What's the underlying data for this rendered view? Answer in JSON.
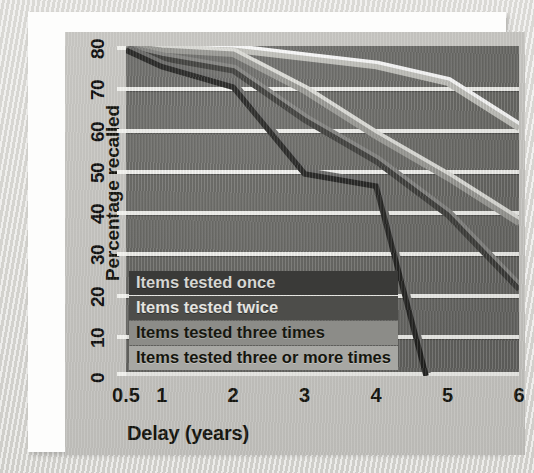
{
  "figure": {
    "panel_bg": "#c4c3bf",
    "plot_bg": "#6a6a67",
    "gridline_color": "#f4f4f0"
  },
  "chart_data": {
    "type": "line",
    "title": "",
    "xlabel": "Delay (years)",
    "ylabel": "Percentage recalled",
    "xtick_labels": [
      "0.5",
      "1",
      "2",
      "3",
      "4",
      "5",
      "6"
    ],
    "xtick_values": [
      0.5,
      1,
      2,
      3,
      4,
      5,
      6
    ],
    "ytick_labels": [
      "0",
      "10",
      "20",
      "30",
      "40",
      "50",
      "60",
      "70",
      "80"
    ],
    "ytick_values": [
      0,
      10,
      20,
      30,
      40,
      50,
      60,
      70,
      80
    ],
    "ylim": [
      0,
      80
    ],
    "grid": "horizontal",
    "legend_position": "inside-lower-left",
    "series": [
      {
        "name": "Items tested once",
        "color": "#232321",
        "x": [
          0.5,
          1,
          2,
          3,
          4,
          4.7
        ],
        "values": [
          79,
          75,
          70,
          49,
          46,
          0
        ]
      },
      {
        "name": "Items tested twice",
        "color": "#3d3d3a",
        "x": [
          0.5,
          1,
          2,
          3,
          4,
          5,
          6
        ],
        "values": [
          79,
          77,
          74,
          62,
          52,
          39,
          21
        ]
      },
      {
        "name": "Items tested three times",
        "color": "#9a9a95",
        "x": [
          0.5,
          1,
          2,
          3,
          4,
          5,
          6
        ],
        "values": [
          80,
          79,
          78,
          69,
          58,
          48,
          37
        ]
      },
      {
        "name": "Items tested three or more times",
        "color": "#c3c3bd",
        "x": [
          0.5,
          1,
          2,
          3,
          4,
          5,
          6
        ],
        "values": [
          80,
          79.5,
          79,
          77,
          75,
          71,
          60
        ]
      }
    ]
  }
}
